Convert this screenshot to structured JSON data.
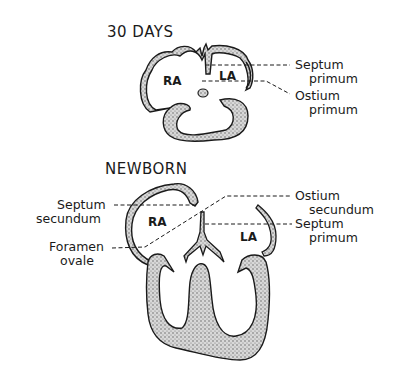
{
  "panels": [
    {
      "id": "30-days",
      "title": "30 DAYS",
      "chambers": [
        "RA",
        "LA"
      ],
      "annotations": [
        {
          "line1": "Septum",
          "line2": "primum"
        },
        {
          "line1": "Ostium",
          "line2": "primum"
        }
      ]
    },
    {
      "id": "newborn",
      "title": "NEWBORN",
      "chambers": [
        "RA",
        "LA"
      ],
      "annotations_left": [
        {
          "line1": "Septum",
          "line2": "secundum"
        },
        {
          "line1": "Foramen",
          "line2": "ovale"
        }
      ],
      "annotations_right": [
        {
          "line1": "Ostium",
          "line2": "secundum"
        },
        {
          "line1": "Septum",
          "line2": "primum"
        }
      ]
    }
  ],
  "colors": {
    "ink": "#1a1a1a",
    "stipple": "#9a9a9a",
    "background": "#ffffff"
  }
}
